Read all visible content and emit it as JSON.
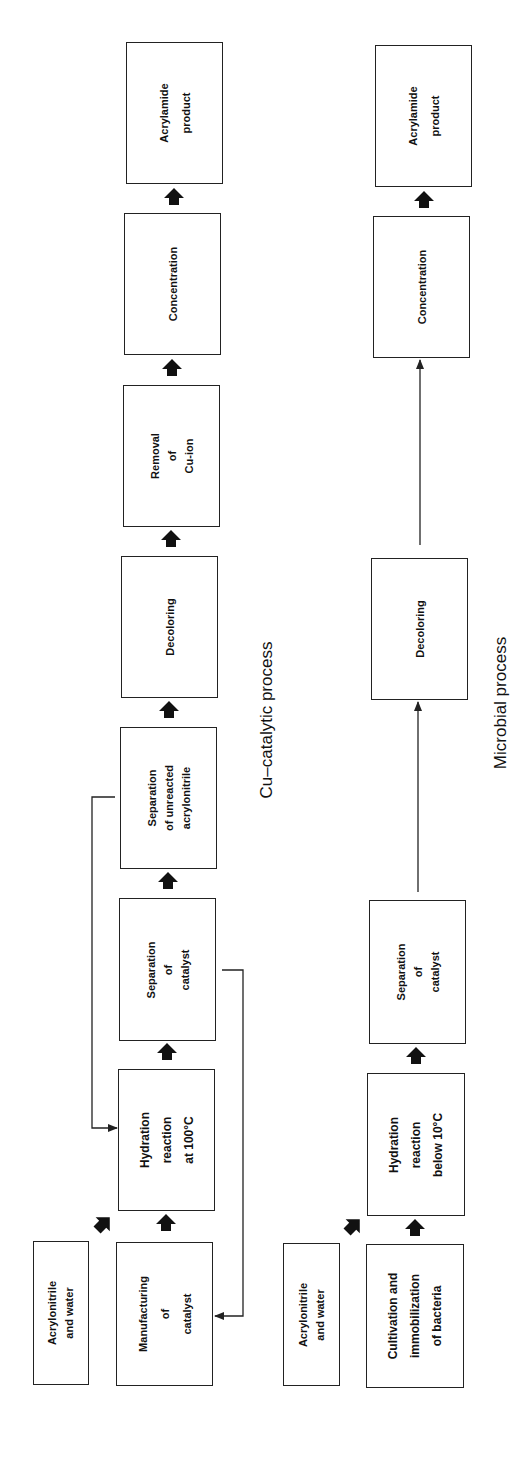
{
  "cu_process": {
    "caption": "Cu–catalytic process",
    "boxes": {
      "feed": [
        "Acrylonitrile",
        "and water"
      ],
      "manufacturing": [
        "Manufacturing",
        "of",
        "catalyst"
      ],
      "hydration": [
        "Hydration",
        "reaction",
        "at 100°C"
      ],
      "sep_catalyst": [
        "Separation",
        "of",
        "catalyst"
      ],
      "sep_unreacted": [
        "Separation",
        "of  unreacted",
        "acrylonitrile"
      ],
      "decoloring": [
        "Decoloring"
      ],
      "removal": [
        "Removal",
        "of",
        "Cu-ion"
      ],
      "concentration": [
        "Concentration"
      ],
      "product": [
        "Acrylamide",
        "product"
      ]
    }
  },
  "microbial_process": {
    "caption": "Microbial process",
    "boxes": {
      "feed": [
        "Acrylonitrile",
        "and water"
      ],
      "cultivation": [
        "Cultivation  and",
        "immobilization",
        "of bacteria"
      ],
      "hydration": [
        "Hydration",
        "reaction",
        "below 10°C"
      ],
      "sep_catalyst": [
        "Separation",
        "of",
        "catalyst"
      ],
      "decoloring": [
        "Decoloring"
      ],
      "concentration": [
        "Concentration"
      ],
      "product": [
        "Acrylamide",
        "product"
      ]
    }
  },
  "colors": {
    "line": "#222222",
    "background": "#ffffff"
  }
}
